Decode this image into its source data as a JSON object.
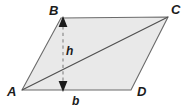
{
  "figure": {
    "kind": "parallelogram-area-diagram",
    "background_color": "#ffffff",
    "fill_color": "#e9e9e9",
    "stroke_color": "#5a5a5a",
    "diagonal_color": "#4a4a4a",
    "dashed_color": "#8a8a8a",
    "arrow_color": "#1b1b1b",
    "label_color": "#1b1b1b",
    "vertices": {
      "A": {
        "label": "A",
        "x": 22,
        "y": 90
      },
      "B": {
        "label": "B",
        "x": 61,
        "y": 18
      },
      "C": {
        "label": "C",
        "x": 168,
        "y": 17
      },
      "D": {
        "label": "D",
        "x": 131,
        "y": 90
      }
    },
    "measures": {
      "height": {
        "label": "h",
        "from_x": 63,
        "from_y": 18,
        "to_x": 63,
        "to_y": 90
      },
      "base": {
        "label": "b",
        "from_x": 22,
        "from_y": 90,
        "to_x": 131,
        "to_y": 90
      }
    },
    "diagonal": {
      "from": "A",
      "to": "C"
    }
  }
}
